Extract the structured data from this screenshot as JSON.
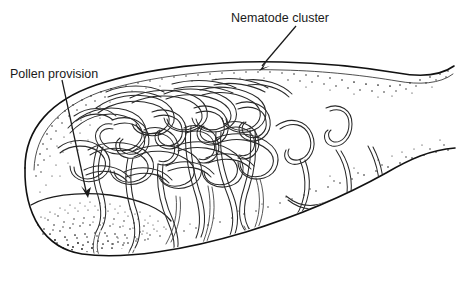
{
  "figure": {
    "background_color": "#ffffff",
    "ink_color": "#111111",
    "width": 456,
    "height": 282
  },
  "labels": {
    "nematode_cluster": {
      "text": "Nematode cluster",
      "x": 280,
      "y": 18,
      "anchor": "middle"
    },
    "pollen_provision": {
      "text": "Pollen provision",
      "x": 54,
      "y": 74,
      "anchor": "middle"
    }
  },
  "annotations": {
    "nematode_arrow": {
      "from_x": 296,
      "from_y": 26,
      "to_x": 259,
      "to_y": 70,
      "style": "solid-arrowhead"
    },
    "pollen_arrow": {
      "from_x": 62,
      "from_y": 80,
      "to_x": 88,
      "to_y": 197,
      "style": "solid-arrowhead"
    }
  },
  "structures": {
    "brood_cell": {
      "name": "brood cell outline",
      "description": "elongated tapering chamber, blunt rounded left end, narrow neck exiting right edge",
      "left_extent": 22,
      "right_extent": 456,
      "top_extent": 60,
      "bottom_extent": 258
    },
    "pollen_mass": {
      "name": "pollen provision",
      "description": "stippled lens-shaped mass resting in lower-left of cell",
      "shading": "dense stipple, darkest at lower left"
    },
    "nematode_cluster": {
      "name": "nematode cluster",
      "description": "dense tangle of outlined worm-like nematodes filling upper-left and centre of cell, with individual worms trailing to the right"
    },
    "wall_texture": {
      "name": "cell wall stipple",
      "description": "fine stipple lining the inner face of the cell wall"
    }
  }
}
